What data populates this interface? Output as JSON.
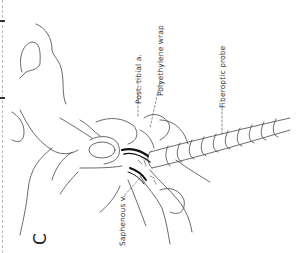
{
  "figure": {
    "panel_letter": "C",
    "orientation": "rotated-90-ccw",
    "labels": {
      "post_tibial": "Post. tibial a.",
      "polyethylene": "Polyethylene wrap",
      "fiberoptic": "Fiberoptic probe",
      "saphenous": "Saphenous v."
    },
    "leaders": {
      "post_tibial": "- - -",
      "polyethylene": "- - -",
      "fiberoptic": "- - -",
      "saphenous": "- - -"
    }
  }
}
